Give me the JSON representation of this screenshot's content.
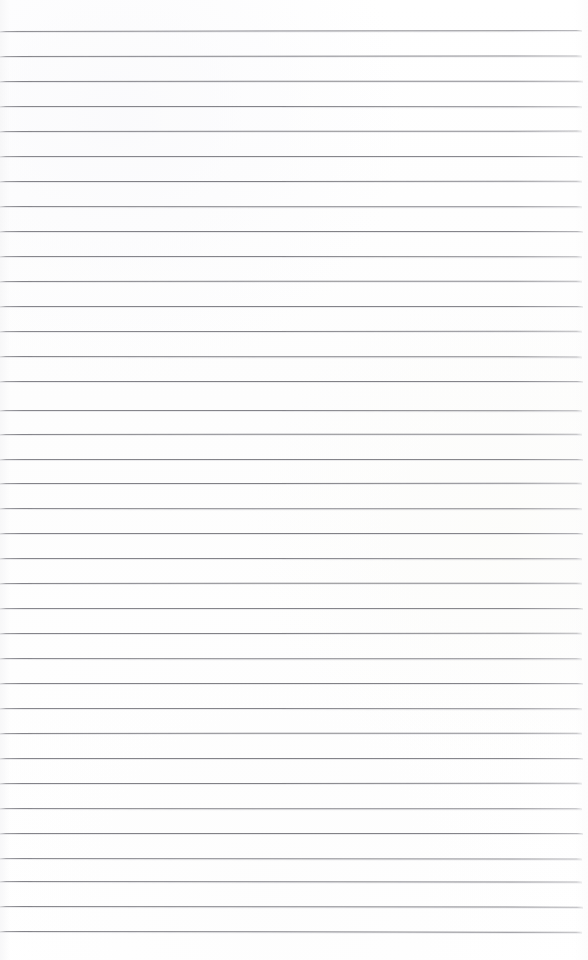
{
  "document": {
    "type": "lined-notebook-paper",
    "title": "Blank Ruled Notepad Page",
    "page_width": 588,
    "page_height": 960,
    "content_text": "",
    "is_blank": true
  },
  "paper": {
    "background_color": "#fefefe",
    "texture": "scanned-paper",
    "edge_shading": "faint-left-falloff"
  },
  "ruling": {
    "style": "wide-ruled horizontal lines",
    "line_color": "#7c7c82",
    "line_count": 37,
    "first_line_y": 31,
    "line_spacing": 25,
    "line_thickness": 1,
    "line_start_x": 0,
    "line_end_x": 582,
    "has_vertical_margin_line": false,
    "lines": [
      {
        "index": 1,
        "y": 31,
        "x_start": 0,
        "x_end": 582,
        "tilt_deg": -0.09,
        "opacity": 0.92
      },
      {
        "index": 2,
        "y": 56,
        "x_start": 0,
        "x_end": 582,
        "tilt_deg": -0.05,
        "opacity": 0.95
      },
      {
        "index": 3,
        "y": 81,
        "x_start": 0,
        "x_end": 583,
        "tilt_deg": -0.03,
        "opacity": 0.97
      },
      {
        "index": 4,
        "y": 106,
        "x_start": 0,
        "x_end": 582,
        "tilt_deg": 0.02,
        "opacity": 0.94
      },
      {
        "index": 5,
        "y": 131,
        "x_start": 0,
        "x_end": 582,
        "tilt_deg": -0.04,
        "opacity": 0.96
      },
      {
        "index": 6,
        "y": 156,
        "x_start": 0,
        "x_end": 583,
        "tilt_deg": 0.01,
        "opacity": 0.93
      },
      {
        "index": 7,
        "y": 181,
        "x_start": 0,
        "x_end": 582,
        "tilt_deg": -0.02,
        "opacity": 0.97
      },
      {
        "index": 8,
        "y": 206,
        "x_start": 0,
        "x_end": 582,
        "tilt_deg": 0.03,
        "opacity": 0.95
      },
      {
        "index": 9,
        "y": 231,
        "x_start": 0,
        "x_end": 583,
        "tilt_deg": -0.01,
        "opacity": 0.96
      },
      {
        "index": 10,
        "y": 256,
        "x_start": 0,
        "x_end": 582,
        "tilt_deg": 0.02,
        "opacity": 0.94
      },
      {
        "index": 11,
        "y": 281,
        "x_start": 0,
        "x_end": 582,
        "tilt_deg": -0.03,
        "opacity": 0.97
      },
      {
        "index": 12,
        "y": 306,
        "x_start": 0,
        "x_end": 583,
        "tilt_deg": 0.01,
        "opacity": 0.95
      },
      {
        "index": 13,
        "y": 331,
        "x_start": 0,
        "x_end": 582,
        "tilt_deg": -0.02,
        "opacity": 0.93
      },
      {
        "index": 14,
        "y": 356,
        "x_start": 0,
        "x_end": 582,
        "tilt_deg": 0.04,
        "opacity": 0.96
      },
      {
        "index": 15,
        "y": 381,
        "x_start": 0,
        "x_end": 583,
        "tilt_deg": -0.01,
        "opacity": 0.97
      },
      {
        "index": 16,
        "y": 410,
        "x_start": 0,
        "x_end": 582,
        "tilt_deg": 0.02,
        "opacity": 0.94
      },
      {
        "index": 17,
        "y": 434,
        "x_start": 0,
        "x_end": 582,
        "tilt_deg": -0.03,
        "opacity": 0.96
      },
      {
        "index": 18,
        "y": 459,
        "x_start": 0,
        "x_end": 583,
        "tilt_deg": 0.01,
        "opacity": 0.95
      },
      {
        "index": 19,
        "y": 483,
        "x_start": 0,
        "x_end": 582,
        "tilt_deg": -0.02,
        "opacity": 0.97
      },
      {
        "index": 20,
        "y": 508,
        "x_start": 0,
        "x_end": 582,
        "tilt_deg": 0.03,
        "opacity": 0.94
      },
      {
        "index": 21,
        "y": 533,
        "x_start": 0,
        "x_end": 583,
        "tilt_deg": -0.01,
        "opacity": 0.96
      },
      {
        "index": 22,
        "y": 558,
        "x_start": 0,
        "x_end": 582,
        "tilt_deg": 0.02,
        "opacity": 0.95
      },
      {
        "index": 23,
        "y": 583,
        "x_start": 0,
        "x_end": 582,
        "tilt_deg": -0.03,
        "opacity": 0.97
      },
      {
        "index": 24,
        "y": 608,
        "x_start": 0,
        "x_end": 583,
        "tilt_deg": 0.01,
        "opacity": 0.94
      },
      {
        "index": 25,
        "y": 633,
        "x_start": 0,
        "x_end": 582,
        "tilt_deg": -0.02,
        "opacity": 0.96
      },
      {
        "index": 26,
        "y": 658,
        "x_start": 0,
        "x_end": 582,
        "tilt_deg": 0.03,
        "opacity": 0.95
      },
      {
        "index": 27,
        "y": 683,
        "x_start": 0,
        "x_end": 583,
        "tilt_deg": -0.01,
        "opacity": 0.97
      },
      {
        "index": 28,
        "y": 708,
        "x_start": 0,
        "x_end": 582,
        "tilt_deg": 0.02,
        "opacity": 0.94
      },
      {
        "index": 29,
        "y": 733,
        "x_start": 0,
        "x_end": 582,
        "tilt_deg": -0.03,
        "opacity": 0.96
      },
      {
        "index": 30,
        "y": 758,
        "x_start": 0,
        "x_end": 583,
        "tilt_deg": 0.01,
        "opacity": 0.95
      },
      {
        "index": 31,
        "y": 783,
        "x_start": 0,
        "x_end": 582,
        "tilt_deg": -0.02,
        "opacity": 0.97
      },
      {
        "index": 32,
        "y": 808,
        "x_start": 0,
        "x_end": 582,
        "tilt_deg": 0.03,
        "opacity": 0.94
      },
      {
        "index": 33,
        "y": 833,
        "x_start": 0,
        "x_end": 583,
        "tilt_deg": -0.01,
        "opacity": 0.96
      },
      {
        "index": 34,
        "y": 858,
        "x_start": 0,
        "x_end": 582,
        "tilt_deg": 0.05,
        "opacity": 0.93
      },
      {
        "index": 35,
        "y": 881,
        "x_start": 0,
        "x_end": 582,
        "tilt_deg": 0.06,
        "opacity": 0.96
      },
      {
        "index": 36,
        "y": 906,
        "x_start": 0,
        "x_end": 583,
        "tilt_deg": 0.07,
        "opacity": 0.97
      },
      {
        "index": 37,
        "y": 931,
        "x_start": 0,
        "x_end": 582,
        "tilt_deg": 0.08,
        "opacity": 0.97
      }
    ]
  }
}
